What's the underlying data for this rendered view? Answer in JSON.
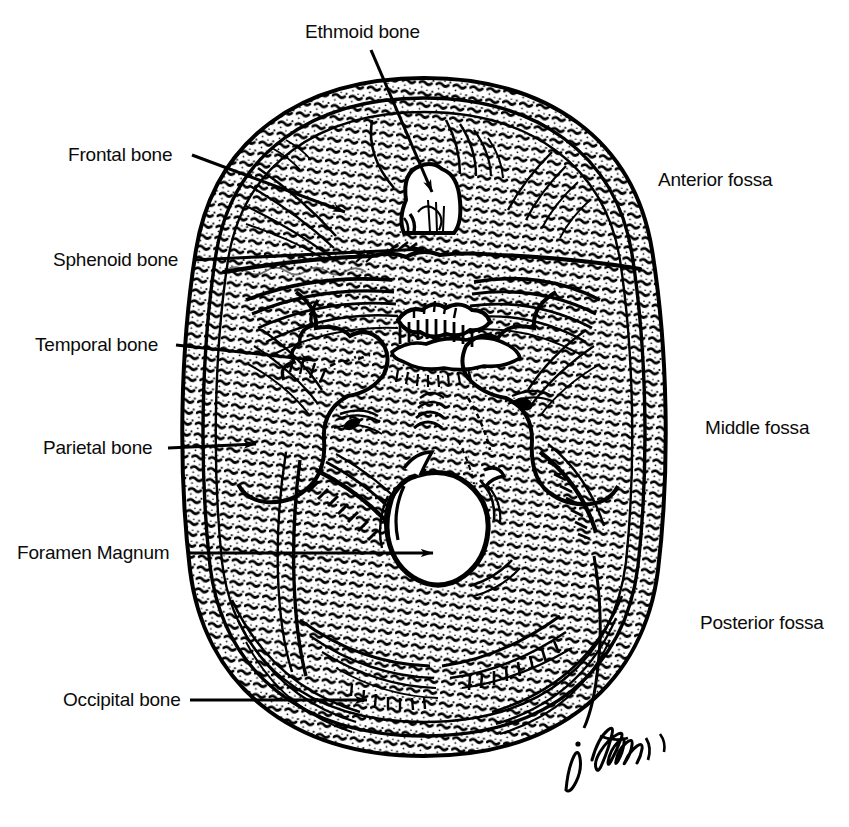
{
  "figure": {
    "kind": "anatomical-line-drawing",
    "artist_signature": "J. Harrington",
    "ink_color": "#000000",
    "background_color": "#ffffff"
  },
  "labels": {
    "ethmoid": {
      "text": "Ethmoid bone",
      "x": 305,
      "y": 22,
      "align": "left"
    },
    "frontal": {
      "text": "Frontal bone",
      "x": 68,
      "y": 145,
      "align": "left"
    },
    "sphenoid": {
      "text": "Sphenoid bone",
      "x": 53,
      "y": 250,
      "align": "left"
    },
    "temporal": {
      "text": "Temporal bone",
      "x": 35,
      "y": 335,
      "align": "left"
    },
    "parietal": {
      "text": "Parietal bone",
      "x": 43,
      "y": 438,
      "align": "left"
    },
    "foramen_magnum": {
      "text": "Foramen Magnum",
      "x": 17,
      "y": 545,
      "align": "left"
    },
    "occipital": {
      "text": "Occipital bone",
      "x": 63,
      "y": 692,
      "align": "left"
    },
    "anterior_fossa": {
      "text": "Anterior fossa",
      "x": 658,
      "y": 170,
      "align": "left"
    },
    "middle_fossa": {
      "text": "Middle fossa",
      "x": 705,
      "y": 418,
      "align": "left"
    },
    "posterior_fossa": {
      "text": "Posterior fossa",
      "x": 700,
      "y": 613,
      "align": "left"
    }
  },
  "leader_lines": [
    {
      "name": "ethmoid-leader",
      "from": [
        371,
        50
      ],
      "to": [
        432,
        192
      ],
      "arrow": true
    },
    {
      "name": "frontal-leader",
      "from": [
        192,
        155
      ],
      "to": [
        345,
        212
      ],
      "arrow": true
    },
    {
      "name": "sphenoid-leader",
      "from": [
        193,
        260
      ],
      "to": [
        424,
        249
      ],
      "arrow": true
    },
    {
      "name": "temporal-leader",
      "from": [
        176,
        345
      ],
      "to": [
        313,
        360
      ],
      "arrow": true
    },
    {
      "name": "parietal-leader",
      "from": [
        168,
        448
      ],
      "to": [
        256,
        444
      ],
      "arrow": true
    },
    {
      "name": "foramen-magnum-leader",
      "from": [
        190,
        553
      ],
      "to": [
        433,
        553
      ],
      "arrow": true
    },
    {
      "name": "occipital-leader",
      "from": [
        190,
        700
      ],
      "to": [
        367,
        700
      ],
      "arrow": true
    }
  ]
}
